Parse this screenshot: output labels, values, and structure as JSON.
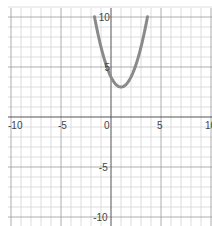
{
  "chart_data": {
    "type": "line",
    "title": "",
    "xlabel": "",
    "ylabel": "",
    "xlim": [
      -10,
      10
    ],
    "ylim": [
      -10,
      10
    ],
    "grid": true,
    "minor_step": 1,
    "major_step": 5,
    "x_tick_labels": [
      "-10",
      "-5",
      "0",
      "5",
      "10"
    ],
    "x_tick_values": [
      -10,
      -5,
      0,
      5,
      10
    ],
    "y_tick_labels": [
      "10",
      "5",
      "-5",
      "-10"
    ],
    "y_tick_values": [
      10,
      5,
      -5,
      -10
    ],
    "series": [
      {
        "name": "parabola",
        "equation": "y = (x - 1)^2 + 3",
        "vertex": [
          1,
          3
        ],
        "y_intercept": 4,
        "x_domain": [
          -1.65,
          3.65
        ],
        "color": "#8a8a8a"
      }
    ]
  }
}
